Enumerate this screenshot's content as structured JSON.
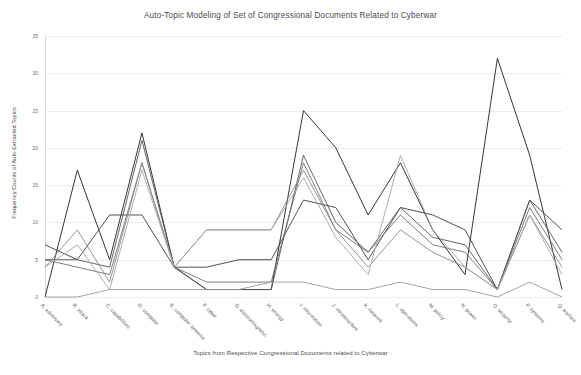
{
  "chart_data": {
    "type": "line",
    "title": "Auto-Topic Modeling of Set of Congressional Documents Related to Cyberwar",
    "xlabel": "Topics from Respective Congressional Documents related to Cyberwar",
    "ylabel": "Frequency Counts of  Auto-Extracted Topics",
    "ylim": [
      0,
      35
    ],
    "yticks": [
      0,
      5,
      10,
      15,
      20,
      25,
      30,
      35
    ],
    "grid": true,
    "legend": "none",
    "categories": [
      "A. adversary",
      "B. attack",
      "C. capabilities",
      "D. computer",
      "E. computer systems",
      "F. cyber",
      "G. electromagnetic",
      "H. energy",
      "I. information",
      "J. infrastructure",
      "K. network",
      "L. operations",
      "M. policy",
      "N. power",
      "O. security",
      "P. systems",
      "Q. warfare"
    ],
    "series": [
      {
        "name": "Series 1",
        "color": "#1e1e1e",
        "values": [
          0,
          17,
          5,
          22,
          4,
          1,
          1,
          1,
          25,
          20,
          11,
          18,
          9,
          3,
          32,
          19,
          1
        ]
      },
      {
        "name": "Series 2",
        "color": "#3d3d3d",
        "values": [
          7,
          5,
          11,
          11,
          4,
          4,
          5,
          5,
          13,
          12,
          5,
          12,
          11,
          9,
          1,
          13,
          9
        ]
      },
      {
        "name": "Series 3",
        "color": "#555555",
        "values": [
          5,
          5,
          4,
          21,
          4,
          1,
          1,
          1,
          19,
          10,
          6,
          12,
          8,
          7,
          1,
          13,
          6
        ]
      },
      {
        "name": "Series 4",
        "color": "#6e6e6e",
        "values": [
          5,
          4,
          3,
          18,
          4,
          2,
          2,
          2,
          18,
          9,
          6,
          11,
          7,
          6,
          1,
          12,
          5
        ]
      },
      {
        "name": "Series 5",
        "color": "#8a8a8a",
        "values": [
          4,
          9,
          2,
          18,
          4,
          9,
          9,
          9,
          17,
          9,
          4,
          9,
          6,
          4,
          1,
          11,
          4
        ]
      },
      {
        "name": "Series 6",
        "color": "#a5a5a5",
        "values": [
          4,
          7,
          1,
          17,
          4,
          9,
          9,
          9,
          16,
          8,
          3,
          19,
          9,
          4,
          1,
          11,
          3
        ]
      },
      {
        "name": "Series 7",
        "color": "#9a9a9a",
        "values": [
          0,
          0,
          1,
          1,
          1,
          1,
          1,
          2,
          2,
          1,
          1,
          2,
          1,
          1,
          0,
          2,
          0
        ]
      }
    ]
  }
}
